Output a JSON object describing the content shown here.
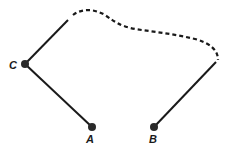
{
  "diagram": {
    "type": "graph-path",
    "colors": {
      "stroke": "#1a1a1a",
      "node": "#2a2a2a",
      "background": "#ffffff"
    },
    "nodes": [
      {
        "id": "C",
        "label": "C"
      },
      {
        "id": "A",
        "label": "A"
      },
      {
        "id": "B",
        "label": "B"
      }
    ],
    "edges": [
      {
        "from": "C",
        "to": "A",
        "style": "solid"
      },
      {
        "from": "C",
        "to": "B",
        "style": "solid-dashed-solid",
        "note": "solid segments at ends, dashed curved middle"
      }
    ]
  }
}
